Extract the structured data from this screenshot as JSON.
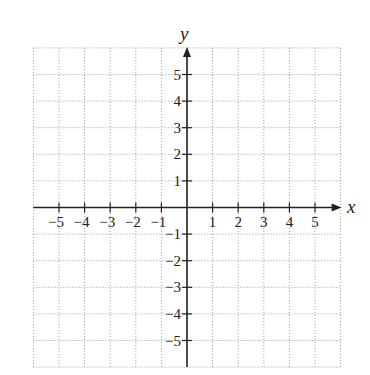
{
  "chart_data": {
    "type": "scatter",
    "title": "",
    "xlabel": "x",
    "ylabel": "y",
    "xlim": [
      -6,
      6
    ],
    "ylim": [
      -6,
      6
    ],
    "grid": true,
    "grid_style": "dotted",
    "x_ticks": [
      -5,
      -4,
      -3,
      -2,
      -1,
      1,
      2,
      3,
      4,
      5
    ],
    "y_ticks": [
      5,
      4,
      3,
      2,
      1,
      -1,
      -2,
      -3,
      -4,
      -5
    ],
    "x_tick_labels": [
      "−5",
      "−4",
      "−3",
      "−2",
      "−1",
      "1",
      "2",
      "3",
      "4",
      "5"
    ],
    "y_tick_labels": [
      "5",
      "4",
      "3",
      "2",
      "1",
      "−1",
      "−2",
      "−3",
      "−4",
      "−5"
    ],
    "series": []
  },
  "axes": {
    "x_label": "x",
    "y_label": "y"
  },
  "colors": {
    "axis": "#222222",
    "grid": "#9a9a9a",
    "background": "#ffffff"
  }
}
